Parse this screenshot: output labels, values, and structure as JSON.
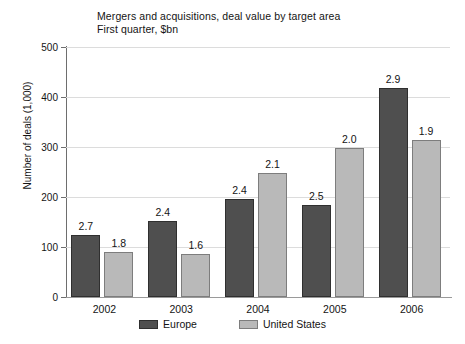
{
  "chart_data": {
    "type": "bar",
    "title": "Mergers and acquisitions, deal value by target area",
    "subtitle": "First quarter, $bn",
    "xlabel": "",
    "ylabel": "Number of deals (1,000)",
    "ylim": [
      0,
      500
    ],
    "yticks": [
      0,
      100,
      200,
      300,
      400,
      500
    ],
    "ytick_labels": [
      "0",
      "100",
      "200",
      "300",
      "400",
      "500"
    ],
    "grid": true,
    "legend_position": "bottom",
    "categories": [
      "2002",
      "2003",
      "2004",
      "2005",
      "2006"
    ],
    "series": [
      {
        "name": "Europe",
        "color": "#4f4f4f",
        "values": [
          124,
          152,
          197,
          185,
          418
        ],
        "labels": [
          "2.7",
          "2.4",
          "2.4",
          "2.5",
          "2.9"
        ]
      },
      {
        "name": "United States",
        "color": "#b9b9b9",
        "values": [
          90,
          86,
          249,
          298,
          315
        ],
        "labels": [
          "1.8",
          "1.6",
          "2.1",
          "2.0",
          "1.9"
        ]
      }
    ]
  },
  "legend": {
    "items": [
      {
        "label": "Europe",
        "swatch": "europe"
      },
      {
        "label": "United States",
        "swatch": "us"
      }
    ]
  }
}
